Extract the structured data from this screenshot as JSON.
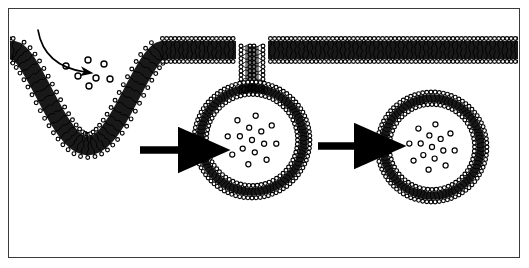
{
  "figure": {
    "border_color": "#3a3a3a",
    "background_color": "#ffffff",
    "ink_color": "#000000",
    "width": 529,
    "height": 268
  },
  "membrane": {
    "name": "phospholipid-bilayer",
    "head_shape": "circle",
    "head_fill": "#ffffff",
    "head_stroke": "#000000",
    "tail_style": "wavy-line",
    "tail_color": "#000000",
    "core_fill": "#000000",
    "description": "Plasma membrane drawn as a lipid bilayer with beaded polar heads on both faces and dense hydrophobic tails between them."
  },
  "stages": [
    {
      "id": "stage-1",
      "name": "membrane-invagination",
      "label": "Coated pit (invagination)",
      "center_x": 88,
      "center_y": 110,
      "description": "U-shaped inward pocket of the plasma membrane collecting cargo particles."
    },
    {
      "id": "stage-2",
      "name": "budding-vesicle",
      "label": "Budding vesicle attached by neck",
      "center_x": 252,
      "center_y": 140,
      "radius": 58,
      "neck_width": 16,
      "description": "Nearly spherical vesicle still joined to the membrane by a narrow neck; cargo enclosed in the lumen."
    },
    {
      "id": "stage-3",
      "name": "free-vesicle",
      "label": "Released free vesicle",
      "center_x": 432,
      "center_y": 147,
      "radius": 55,
      "description": "Fully detached spherical vesicle with concentric bilayer and an interior cluster of cargo particles."
    }
  ],
  "cargo": {
    "name": "cargo-particles",
    "label": "Extracellular cargo / ligand particles",
    "shape": "open-circle",
    "fill": "#ffffff",
    "stroke": "#000000",
    "free_count": 7,
    "free_positions": [
      [
        66,
        66
      ],
      [
        88,
        60
      ],
      [
        78,
        76
      ],
      [
        96,
        78
      ],
      [
        104,
        64
      ],
      [
        110,
        79
      ],
      [
        89,
        86
      ]
    ],
    "vesicle2_count": 15,
    "vesicle3_count": 15
  },
  "entry_arrow": {
    "name": "cargo-entry-arrow",
    "style": "curved-thin",
    "label": "Direction of incoming material",
    "start": [
      38,
      30
    ],
    "end": [
      85,
      72
    ]
  },
  "transition_arrows": [
    {
      "name": "transition-arrow-1",
      "label": "Pit matures into budding vesicle",
      "x1": 140,
      "y1": 150,
      "x2": 196,
      "y2": 150,
      "style": "thick-solid"
    },
    {
      "name": "transition-arrow-2",
      "label": "Vesicle pinches off and is released",
      "x1": 318,
      "y1": 146,
      "x2": 372,
      "y2": 146,
      "style": "thick-solid"
    }
  ]
}
